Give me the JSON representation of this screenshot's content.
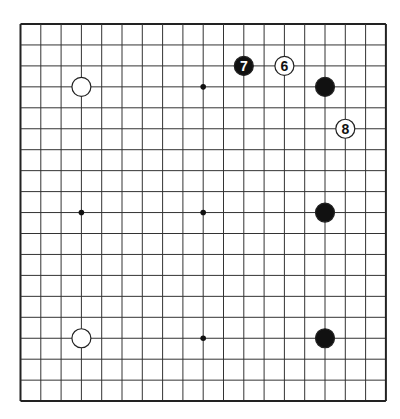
{
  "board": {
    "size": 19,
    "origin_x": 20.5,
    "origin_y": 24,
    "step_x": 20.3,
    "step_y": 20.95,
    "line_color": "#333333",
    "border_color": "#222222"
  },
  "star_points": [
    [
      3,
      3
    ],
    [
      9,
      3
    ],
    [
      15,
      3
    ],
    [
      3,
      9
    ],
    [
      9,
      9
    ],
    [
      15,
      9
    ],
    [
      3,
      15
    ],
    [
      9,
      15
    ],
    [
      15,
      15
    ]
  ],
  "stones": [
    {
      "color": "white",
      "col": 3,
      "row": 3,
      "label": ""
    },
    {
      "color": "white",
      "col": 3,
      "row": 15,
      "label": ""
    },
    {
      "color": "black",
      "col": 15,
      "row": 3,
      "label": ""
    },
    {
      "color": "black",
      "col": 15,
      "row": 9,
      "label": ""
    },
    {
      "color": "black",
      "col": 15,
      "row": 15,
      "label": ""
    },
    {
      "color": "white",
      "col": 13,
      "row": 2,
      "label": "6"
    },
    {
      "color": "black",
      "col": 11,
      "row": 2,
      "label": "7"
    },
    {
      "color": "white",
      "col": 16,
      "row": 5,
      "label": "8"
    }
  ]
}
